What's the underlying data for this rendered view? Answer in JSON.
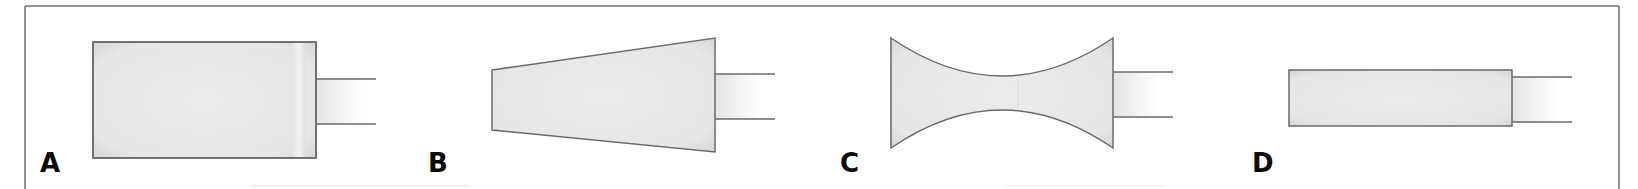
{
  "figure": {
    "frame_color": "#6e6e6e",
    "outline_color": "#6a6a6a",
    "fill_color": "#e6e6e6",
    "panels": [
      {
        "label": "A",
        "shape": "cylinder",
        "label_x": 40,
        "label_y": 150
      },
      {
        "label": "B",
        "shape": "inverted-cone",
        "label_x": 430,
        "label_y": 150
      },
      {
        "label": "C",
        "shape": "hourglass",
        "label_x": 840,
        "label_y": 150
      },
      {
        "label": "D",
        "shape": "narrow-cylinder",
        "label_x": 1252,
        "label_y": 150
      }
    ]
  }
}
